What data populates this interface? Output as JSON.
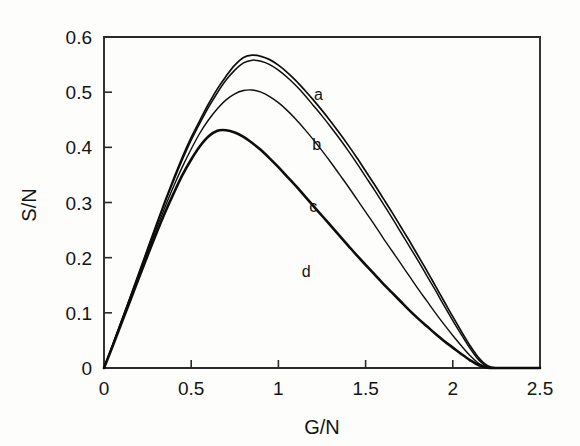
{
  "figure": {
    "background_color": "#fdfdfc",
    "foreground_color": "#0d0d0d"
  },
  "chart_data": {
    "type": "line",
    "title": "",
    "subtitle": "",
    "xlabel": "G/N",
    "ylabel": "S/N",
    "xlim": [
      0,
      2.5
    ],
    "ylim": [
      0,
      0.6
    ],
    "xticks": [
      0,
      0.5,
      1,
      1.5,
      2,
      2.5
    ],
    "xticklabels": [
      "0",
      "0.5",
      "1",
      "1.5",
      "2",
      "2.5"
    ],
    "yticks": [
      0,
      0.1,
      0.2,
      0.3,
      0.4,
      0.5,
      0.6
    ],
    "yticklabels": [
      "0",
      "0.1",
      "0.2",
      "0.3",
      "0.4",
      "0.5",
      "0.6"
    ],
    "grid": false,
    "legend_position": "inline-annotations",
    "annotations": [
      {
        "text": "a",
        "x": 1.23,
        "y": 0.485
      },
      {
        "text": "b",
        "x": 1.22,
        "y": 0.395
      },
      {
        "text": "c",
        "x": 1.2,
        "y": 0.283
      },
      {
        "text": "d",
        "x": 1.16,
        "y": 0.165
      }
    ],
    "series": [
      {
        "name": "a",
        "label": "a",
        "color": "#0d0d0d",
        "linewidth": 1.7,
        "peak": {
          "x": 0.8,
          "y": 0.567
        },
        "zero_crossing": 2.22,
        "x": [
          0,
          0.05,
          0.1,
          0.15,
          0.2,
          0.25,
          0.3,
          0.35,
          0.4,
          0.45,
          0.5,
          0.55,
          0.6,
          0.65,
          0.7,
          0.75,
          0.8,
          0.85,
          0.9,
          0.95,
          1.0,
          1.05,
          1.1,
          1.15,
          1.2,
          1.25,
          1.3,
          1.35,
          1.4,
          1.45,
          1.5,
          1.55,
          1.6,
          1.65,
          1.7,
          1.75,
          1.8,
          1.85,
          1.9,
          1.95,
          2.0,
          2.05,
          2.1,
          2.15,
          2.2,
          2.25,
          2.3,
          2.35,
          2.4,
          2.45,
          2.5
        ],
        "y": [
          0,
          0.042,
          0.085,
          0.128,
          0.172,
          0.216,
          0.26,
          0.303,
          0.344,
          0.383,
          0.418,
          0.449,
          0.479,
          0.506,
          0.529,
          0.549,
          0.563,
          0.567,
          0.565,
          0.559,
          0.549,
          0.536,
          0.521,
          0.504,
          0.486,
          0.467,
          0.447,
          0.426,
          0.404,
          0.381,
          0.357,
          0.333,
          0.308,
          0.283,
          0.257,
          0.231,
          0.204,
          0.177,
          0.149,
          0.121,
          0.093,
          0.066,
          0.04,
          0.018,
          0.004,
          0,
          0,
          0,
          0,
          0,
          0
        ]
      },
      {
        "name": "b",
        "label": "b",
        "color": "#0d0d0d",
        "linewidth": 1.5,
        "peak": {
          "x": 0.78,
          "y": 0.559
        },
        "zero_crossing": 2.2,
        "x": [
          0,
          0.05,
          0.1,
          0.15,
          0.2,
          0.25,
          0.3,
          0.35,
          0.4,
          0.45,
          0.5,
          0.55,
          0.6,
          0.65,
          0.7,
          0.75,
          0.8,
          0.85,
          0.9,
          0.95,
          1.0,
          1.05,
          1.1,
          1.15,
          1.2,
          1.25,
          1.3,
          1.35,
          1.4,
          1.45,
          1.5,
          1.55,
          1.6,
          1.65,
          1.7,
          1.75,
          1.8,
          1.85,
          1.9,
          1.95,
          2.0,
          2.05,
          2.1,
          2.15,
          2.2,
          2.25,
          2.3,
          2.35,
          2.4,
          2.45,
          2.5
        ],
        "y": [
          0,
          0.042,
          0.085,
          0.128,
          0.171,
          0.215,
          0.258,
          0.3,
          0.34,
          0.378,
          0.413,
          0.444,
          0.473,
          0.499,
          0.522,
          0.54,
          0.553,
          0.558,
          0.556,
          0.55,
          0.54,
          0.527,
          0.512,
          0.495,
          0.476,
          0.457,
          0.437,
          0.416,
          0.394,
          0.371,
          0.347,
          0.323,
          0.298,
          0.273,
          0.247,
          0.221,
          0.195,
          0.168,
          0.141,
          0.113,
          0.086,
          0.06,
          0.035,
          0.014,
          0.002,
          0,
          0,
          0,
          0,
          0,
          0
        ]
      },
      {
        "name": "c",
        "label": "c",
        "color": "#0d0d0d",
        "linewidth": 1.4,
        "peak": {
          "x": 0.72,
          "y": 0.504
        },
        "zero_crossing": 2.18,
        "x": [
          0,
          0.05,
          0.1,
          0.15,
          0.2,
          0.25,
          0.3,
          0.35,
          0.4,
          0.45,
          0.5,
          0.55,
          0.6,
          0.65,
          0.7,
          0.75,
          0.8,
          0.85,
          0.9,
          0.95,
          1.0,
          1.05,
          1.1,
          1.15,
          1.2,
          1.25,
          1.3,
          1.35,
          1.4,
          1.45,
          1.5,
          1.55,
          1.6,
          1.65,
          1.7,
          1.75,
          1.8,
          1.85,
          1.9,
          1.95,
          2.0,
          2.05,
          2.1,
          2.15,
          2.2,
          2.25,
          2.3,
          2.35,
          2.4,
          2.45,
          2.5
        ],
        "y": [
          0,
          0.041,
          0.083,
          0.125,
          0.167,
          0.21,
          0.252,
          0.292,
          0.33,
          0.365,
          0.397,
          0.426,
          0.45,
          0.47,
          0.486,
          0.497,
          0.503,
          0.504,
          0.5,
          0.492,
          0.481,
          0.467,
          0.451,
          0.433,
          0.414,
          0.394,
          0.373,
          0.351,
          0.329,
          0.306,
          0.283,
          0.26,
          0.236,
          0.213,
          0.19,
          0.167,
          0.144,
          0.122,
          0.1,
          0.079,
          0.059,
          0.04,
          0.022,
          0.008,
          0.001,
          0,
          0,
          0,
          0,
          0,
          0
        ]
      },
      {
        "name": "d",
        "label": "d",
        "color": "#0d0d0d",
        "linewidth": 2.6,
        "peak": {
          "x": 0.62,
          "y": 0.431
        },
        "zero_crossing": 2.16,
        "x": [
          0,
          0.05,
          0.1,
          0.15,
          0.2,
          0.25,
          0.3,
          0.35,
          0.4,
          0.45,
          0.5,
          0.55,
          0.6,
          0.65,
          0.7,
          0.75,
          0.8,
          0.85,
          0.9,
          0.95,
          1.0,
          1.05,
          1.1,
          1.15,
          1.2,
          1.25,
          1.3,
          1.35,
          1.4,
          1.45,
          1.5,
          1.55,
          1.6,
          1.65,
          1.7,
          1.75,
          1.8,
          1.85,
          1.9,
          1.95,
          2.0,
          2.05,
          2.1,
          2.15,
          2.2,
          2.25,
          2.3,
          2.35,
          2.4,
          2.45,
          2.5
        ],
        "y": [
          0,
          0.04,
          0.081,
          0.122,
          0.163,
          0.204,
          0.244,
          0.282,
          0.317,
          0.35,
          0.378,
          0.402,
          0.42,
          0.43,
          0.431,
          0.427,
          0.419,
          0.408,
          0.395,
          0.38,
          0.364,
          0.347,
          0.33,
          0.312,
          0.294,
          0.276,
          0.258,
          0.24,
          0.222,
          0.204,
          0.187,
          0.17,
          0.153,
          0.137,
          0.121,
          0.105,
          0.09,
          0.076,
          0.062,
          0.049,
          0.037,
          0.025,
          0.014,
          0.005,
          0.0005,
          0,
          0,
          0,
          0,
          0,
          0
        ]
      }
    ]
  }
}
